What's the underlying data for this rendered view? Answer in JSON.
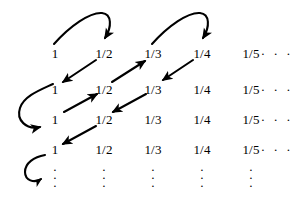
{
  "figure": {
    "ink_color": "#000000",
    "background_color": "#ffffff",
    "width": 301,
    "height": 199
  },
  "grid": {
    "row_count": 4,
    "column_count": 6,
    "column_centers": [
      55,
      104,
      153,
      202,
      251,
      277
    ],
    "row_baselines": [
      53,
      89,
      119,
      149
    ],
    "rows": [
      {
        "cells": [
          "1",
          "1/2",
          "1/3",
          "1/4",
          "1/5",
          "· · ·"
        ]
      },
      {
        "cells": [
          "1",
          "1/2",
          "1/3",
          "1/4",
          "1/5",
          "· · ·"
        ]
      },
      {
        "cells": [
          "1",
          "1/2",
          "1/3",
          "1/4",
          "1/5",
          "· · ·"
        ]
      },
      {
        "cells": [
          "1",
          "1/2",
          "1/3",
          "1/4",
          "1/5",
          "· · ·"
        ]
      }
    ],
    "ellipsis_row": {
      "symbol": "·\n·\n·",
      "column_centers": [
        55,
        104,
        153,
        202,
        251
      ],
      "y": 178
    }
  },
  "arrows": {
    "diagonals": [
      {
        "name": "arrow-r1c2-to-r2c1",
        "direction": "down-left",
        "from": "1/2 (row 1)",
        "to": "1 (row 2)",
        "x1": 96,
        "y1": 60,
        "x2": 63,
        "y2": 82
      },
      {
        "name": "arrow-r2c2-to-r1c3",
        "direction": "up-right",
        "from": "1/2 (row 2)",
        "to": "1/3 (row 1)",
        "x1": 112,
        "y1": 82,
        "x2": 145,
        "y2": 60
      },
      {
        "name": "arrow-r1c4-to-r2c3",
        "direction": "down-left",
        "from": "1/4 (row 1)",
        "to": "1/3 (row 2)",
        "x1": 193,
        "y1": 60,
        "x2": 162,
        "y2": 82
      },
      {
        "name": "arrow-r3c1-to-r2c2",
        "direction": "up-right",
        "from": "1 (row 3)",
        "to": "1/2 (row 2)",
        "x1": 64,
        "y1": 112,
        "x2": 96,
        "y2": 95
      },
      {
        "name": "arrow-r2c3-to-r3c2",
        "direction": "down-left",
        "from": "1/3 (row 2)",
        "to": "1/2 (row 3)",
        "x1": 145,
        "y1": 95,
        "x2": 112,
        "y2": 112
      },
      {
        "name": "arrow-r3c2-to-r4c1",
        "direction": "down-left",
        "from": "1/2 (row 3)",
        "to": "1 (row 4)",
        "x1": 96,
        "y1": 126,
        "x2": 63,
        "y2": 143
      }
    ],
    "arcs": [
      {
        "name": "arc-r1c1-to-r1c2",
        "from": "1 (row 1)",
        "to": "1/2 (row 1)",
        "description": "arc rising right then hooking down"
      },
      {
        "name": "arc-r1c3-to-r1c4",
        "from": "1/3 (row 1)",
        "to": "1/4 (row 1)",
        "description": "arc rising right then hooking down"
      }
    ],
    "hooks": [
      {
        "name": "hook-r2c1-to-r3c1",
        "from": "1 (row 2)",
        "to": "1 (row 3)",
        "description": "U-shaped hook sweeping left and down"
      },
      {
        "name": "hook-r4c1-to-ellipsis",
        "from": "1 (row 4)",
        "to": "vertical ellipsis column 1",
        "description": "small hook curving down-left then right"
      }
    ]
  }
}
